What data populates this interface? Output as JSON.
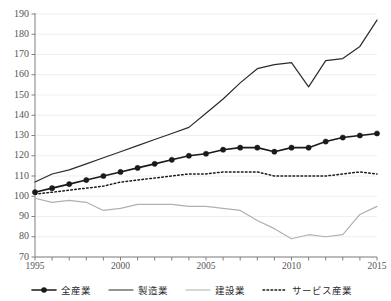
{
  "chart_data": {
    "type": "line",
    "title": "",
    "subtitle": "",
    "xlabel": "",
    "ylabel": "",
    "xlim": [
      1995,
      2015
    ],
    "ylim": [
      70,
      190
    ],
    "ytick_step": 10,
    "grid": true,
    "grid_axis": "y",
    "legend_position": "bottom",
    "x": [
      1995,
      1996,
      1997,
      1998,
      1999,
      2000,
      2001,
      2002,
      2003,
      2004,
      2005,
      2006,
      2007,
      2008,
      2009,
      2010,
      2011,
      2012,
      2013,
      2014,
      2015
    ],
    "ytick_labels": [
      "70",
      "80",
      "90",
      "100",
      "110",
      "120",
      "130",
      "140",
      "150",
      "160",
      "170",
      "180",
      "190"
    ],
    "xtick_labels": [
      "1995",
      "2000",
      "2005",
      "2010",
      "2015"
    ],
    "xtick_label_years": [
      1995,
      2000,
      2005,
      2010,
      2015
    ],
    "series": [
      {
        "name": "全産業",
        "style": "solid-marker",
        "color": "#1a1a1a",
        "width": 1.6,
        "marker": "circle",
        "values": [
          102,
          104,
          106,
          108,
          110,
          112,
          114,
          116,
          118,
          120,
          121,
          123,
          124,
          124,
          122,
          124,
          124,
          127,
          129,
          130,
          131
        ]
      },
      {
        "name": "製造業",
        "style": "solid",
        "color": "#2b2b2b",
        "width": 1.2,
        "marker": "none",
        "values": [
          107,
          111,
          113,
          116,
          119,
          122,
          125,
          128,
          131,
          134,
          141,
          148,
          156,
          163,
          165,
          166,
          154,
          167,
          168,
          174,
          187
        ]
      },
      {
        "name": "建設業",
        "style": "solid",
        "color": "#b0b0b0",
        "width": 1.2,
        "marker": "none",
        "values": [
          99,
          97,
          98,
          97,
          93,
          94,
          96,
          96,
          96,
          95,
          95,
          94,
          93,
          88,
          84,
          79,
          81,
          80,
          81,
          91,
          95
        ]
      },
      {
        "name": "サービス産業",
        "style": "dotted",
        "color": "#1a1a1a",
        "width": 1.5,
        "marker": "none",
        "values": [
          101,
          102,
          103,
          104,
          105,
          107,
          108,
          109,
          110,
          111,
          111,
          112,
          112,
          112,
          110,
          110,
          110,
          110,
          111,
          112,
          111
        ]
      }
    ]
  },
  "legend": {
    "items": [
      {
        "label": "全産業",
        "swatch": "line-with-marker"
      },
      {
        "label": "製造業",
        "swatch": "solid-line"
      },
      {
        "label": "建設業",
        "swatch": "gray-line"
      },
      {
        "label": "サービス産業",
        "swatch": "dotted-line"
      }
    ]
  },
  "colors": {
    "axis": "#808080",
    "grid": "#efefef",
    "primary": "#1a1a1a",
    "secondary": "#2b2b2b",
    "muted": "#b0b0b0",
    "background": "#ffffff"
  }
}
